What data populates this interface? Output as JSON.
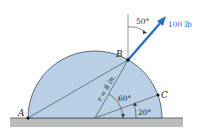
{
  "figure": {
    "force_label": "100 lb",
    "angle_force": "50°",
    "radius_label": "r = 8 in.",
    "angle_B": "60°",
    "angle_C": "20°",
    "point_A": "A",
    "point_B": "B",
    "point_C": "C"
  },
  "colors": {
    "body_fill": "#b9cfe6",
    "body_stroke": "#4a5a6e",
    "ground": "#bcbcbc",
    "arrow": "#2b6cc4",
    "line": "#3a3a3a"
  }
}
